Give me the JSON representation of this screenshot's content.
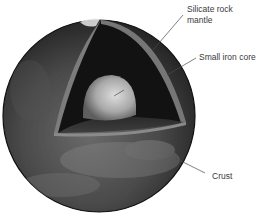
{
  "diagram": {
    "labels": [
      {
        "id": "mantle",
        "line1": "Silicate rock",
        "line2": "mantle"
      },
      {
        "id": "core",
        "text": "Small iron core"
      },
      {
        "id": "crust",
        "text": "Crust"
      }
    ]
  },
  "colors": {
    "background": "#ffffff",
    "surface_dark": "#2e2e2e",
    "surface_mid": "#5a5a5a",
    "mantle_interior": "#121212",
    "mantle_edge": "#7a7a7a",
    "core_light": "#cfcfcf",
    "core_shadow": "#6a6a6a",
    "leader_line": "#4a4a4a",
    "label_text": "#3a3a3a"
  }
}
